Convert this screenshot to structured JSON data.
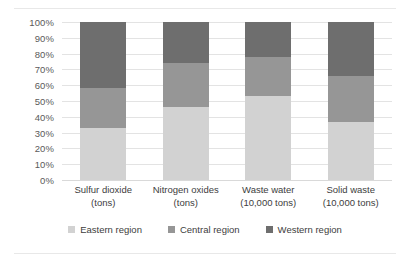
{
  "chart_data": {
    "type": "bar",
    "subtype": "100% stacked column",
    "title": "",
    "xlabel": "",
    "ylabel": "",
    "ylim": [
      0,
      100
    ],
    "grid": true,
    "legend_position": "bottom",
    "axis_tick_suffix": "%",
    "categories": [
      "Sulfur dioxide (tons)",
      "Nitrogen oxides (tons)",
      "Waste water (10,000 tons)",
      "Solid waste (10,000 tons)"
    ],
    "category_lines": [
      [
        "Sulfur dioxide",
        "(tons)"
      ],
      [
        "Nitrogen oxides",
        "(tons)"
      ],
      [
        "Waste water",
        "(10,000 tons)"
      ],
      [
        "Solid waste",
        "(10,000 tons)"
      ]
    ],
    "y_ticks": [
      "100%",
      "90%",
      "80%",
      "70%",
      "60%",
      "50%",
      "40%",
      "30%",
      "20%",
      "10%",
      "0%"
    ],
    "y_tick_values": [
      100,
      90,
      80,
      70,
      60,
      50,
      40,
      30,
      20,
      10,
      0
    ],
    "series": [
      {
        "name": "Eastern region",
        "color": "#d2d2d2",
        "values": [
          33,
          46,
          53,
          37
        ]
      },
      {
        "name": "Central region",
        "color": "#969696",
        "values": [
          25,
          28,
          25,
          29
        ]
      },
      {
        "name": "Western region",
        "color": "#6e6e6e",
        "values": [
          42,
          26,
          22,
          34
        ]
      }
    ]
  },
  "legend": {
    "items": [
      {
        "label": "Eastern region",
        "color": "#d2d2d2"
      },
      {
        "label": "Central region",
        "color": "#969696"
      },
      {
        "label": "Western region",
        "color": "#6e6e6e"
      }
    ]
  }
}
